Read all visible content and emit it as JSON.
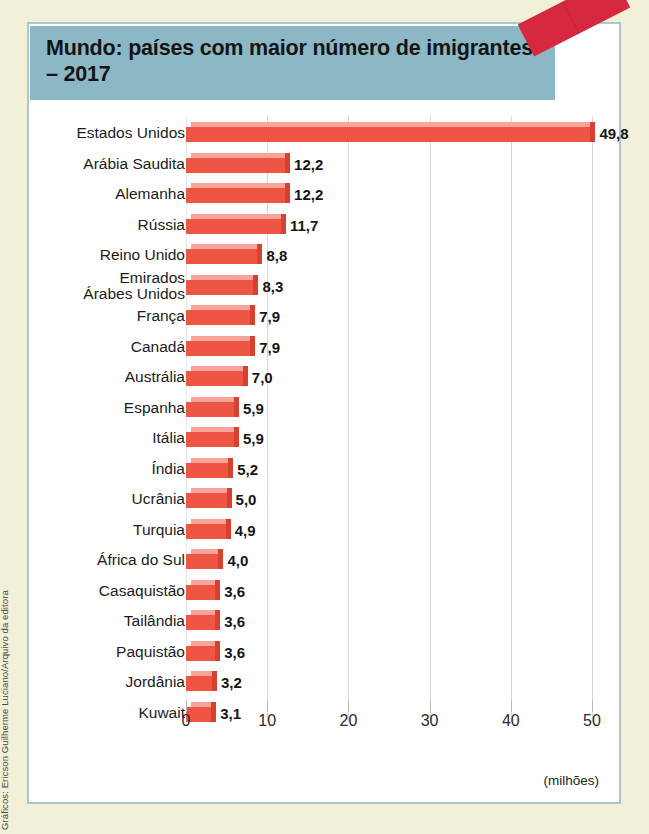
{
  "credit": "Gráficos: Ericson Guilherme Luciano/Arquivo da editora",
  "title": "Mundo: países com maior número\nde imigrantes – 2017",
  "unit_caption": "(milhões)",
  "colors": {
    "page_background": "#f2f1d7",
    "title_band": "#8cb8c6",
    "panel_border": "#a9c8d2",
    "bar_front": "#ef5543",
    "bar_top": "#f8a49a",
    "bar_cap": "#d8402f",
    "tape": "#d8283f",
    "gridline": "#d6d6d6"
  },
  "chart_data": {
    "type": "bar",
    "orientation": "horizontal",
    "title": "Mundo: países com maior número de imigrantes – 2017",
    "xlabel": "(milhões)",
    "ylabel": "",
    "xlim": [
      0,
      52
    ],
    "xticks": [
      "0",
      "10",
      "20",
      "30",
      "40",
      "50"
    ],
    "xtick_values": [
      0,
      10,
      20,
      30,
      40,
      50
    ],
    "grid": true,
    "legend": "none",
    "categories": [
      "Estados Unidos",
      "Arábia Saudita",
      "Alemanha",
      "Rússia",
      "Reino Unido",
      "Emirados\nÁrabes Unidos",
      "França",
      "Canadá",
      "Austrália",
      "Espanha",
      "Itália",
      "Índia",
      "Ucrânia",
      "Turquia",
      "África do Sul",
      "Casaquistão",
      "Tailândia",
      "Paquistão",
      "Jordânia",
      "Kuwait"
    ],
    "values": [
      49.8,
      12.2,
      12.2,
      11.7,
      8.8,
      8.3,
      7.9,
      7.9,
      7.0,
      5.9,
      5.9,
      5.2,
      5.0,
      4.9,
      4.0,
      3.6,
      3.6,
      3.6,
      3.2,
      3.1
    ],
    "value_labels": [
      "49,8",
      "12,2",
      "12,2",
      "11,7",
      "8,8",
      "8,3",
      "7,9",
      "7,9",
      "7,0",
      "5,9",
      "5,9",
      "5,2",
      "5,0",
      "4,9",
      "4,0",
      "3,6",
      "3,6",
      "3,6",
      "3,2",
      "3,1"
    ]
  }
}
